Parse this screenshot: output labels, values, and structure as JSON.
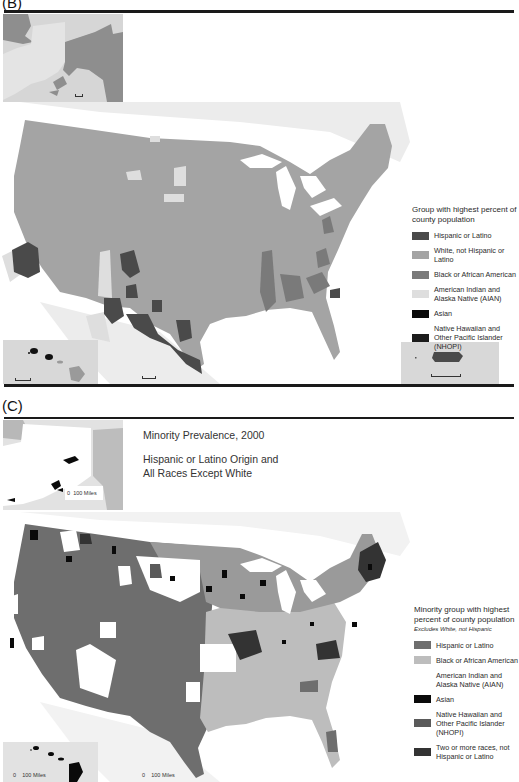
{
  "panel_b": {
    "label": "(B)",
    "legend": {
      "title": "Group with highest percent of county population",
      "items": [
        {
          "label": "Hispanic or Latino",
          "color": "#4a4a4a"
        },
        {
          "label": "White, not Hispanic or Latino",
          "color": "#a4a4a4"
        },
        {
          "label": "Black or African American",
          "color": "#7a7a7a"
        },
        {
          "label": "American Indian and Alaska Native (AIAN)",
          "color": "#dedede"
        },
        {
          "label": "Asian",
          "color": "#0a0a0a"
        },
        {
          "label": "Native Hawaiian and Other Pacific Islander (NHOPI)",
          "color": "#1c1c1c"
        }
      ]
    },
    "insets": [
      "Alaska",
      "Hawaii",
      "Puerto Rico"
    ]
  },
  "panel_c": {
    "label": "(C)",
    "title": "Minority Prevalence, 2000",
    "subtitle": "Hispanic or Latino Origin and All Races Except White",
    "legend": {
      "title": "Minority group with highest percent of county population",
      "subtitle": "Excludes White, not Hispanic",
      "items": [
        {
          "label": "Hispanic or Latino",
          "color": "#6e6e6e"
        },
        {
          "label": "Black or African American",
          "color": "#bdbdbd"
        },
        {
          "label": "American Indian and Alaska Native (AIAN)",
          "color": "#ffffff"
        },
        {
          "label": "Asian",
          "color": "#0a0a0a"
        },
        {
          "label": "Native Hawaiian and Other Pacific Islander (NHOPI)",
          "color": "#5a5a5a"
        },
        {
          "label": "Two or more races, not Hispanic or Latino",
          "color": "#333333"
        }
      ]
    },
    "scale": {
      "alaska": {
        "zero": "0",
        "label": "100 Miles"
      },
      "hawaii": {
        "zero": "0",
        "label": "100 Miles"
      },
      "conus": {
        "zero": "0",
        "label": "100 Miles"
      }
    }
  }
}
